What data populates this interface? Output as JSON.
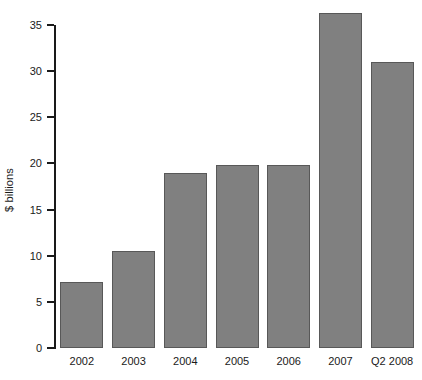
{
  "chart_data": {
    "type": "bar",
    "title": "",
    "subtitle": "",
    "xlabel": "",
    "ylabel": "$ billions",
    "categories": [
      "2002",
      "2003",
      "2004",
      "2005",
      "2006",
      "2007",
      "Q2 2008"
    ],
    "values": [
      7.1,
      10.5,
      19.0,
      19.8,
      19.8,
      36.3,
      31.0
    ],
    "ylim": [
      0,
      35
    ],
    "y_ticks": [
      0,
      5,
      10,
      15,
      20,
      25,
      30,
      35
    ],
    "y_tick_labels": [
      "0",
      "5",
      "10",
      "15",
      "20",
      "25",
      "30",
      "35"
    ],
    "grid": false,
    "legend": false,
    "legend_position": "none",
    "bar_color": "#808080",
    "bar_edge_color": "#585858",
    "axis_color": "#1a1a1a",
    "background_color": "#ffffff",
    "annotations": []
  }
}
